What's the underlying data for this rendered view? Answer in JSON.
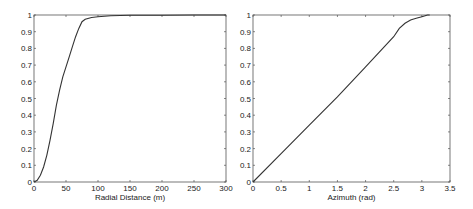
{
  "chart_data": [
    {
      "type": "line",
      "title": "",
      "xlabel": "Radial Distance (m)",
      "ylabel": "",
      "xlim": [
        0,
        300
      ],
      "ylim": [
        0,
        1
      ],
      "xticks": [
        0,
        50,
        100,
        150,
        200,
        250,
        300
      ],
      "yticks": [
        0,
        0.1,
        0.2,
        0.3,
        0.4,
        0.5,
        0.6,
        0.7,
        0.8,
        0.9,
        1
      ],
      "grid": false,
      "series": [
        {
          "name": "CDF",
          "x": [
            0,
            5,
            10,
            15,
            20,
            25,
            30,
            35,
            40,
            45,
            50,
            55,
            60,
            65,
            70,
            75,
            80,
            90,
            100,
            120,
            150,
            200,
            250,
            300
          ],
          "y": [
            0,
            0.01,
            0.04,
            0.09,
            0.16,
            0.25,
            0.35,
            0.46,
            0.55,
            0.63,
            0.69,
            0.75,
            0.81,
            0.87,
            0.92,
            0.96,
            0.975,
            0.985,
            0.99,
            0.995,
            0.998,
            0.999,
            1.0,
            1.0
          ]
        }
      ]
    },
    {
      "type": "line",
      "title": "",
      "xlabel": "Azimuth  (rad)",
      "ylabel": "",
      "xlim": [
        0,
        3.5
      ],
      "ylim": [
        0,
        1
      ],
      "xticks": [
        0,
        0.5,
        1,
        1.5,
        2,
        2.5,
        3,
        3.5
      ],
      "yticks": [
        0,
        0.1,
        0.2,
        0.3,
        0.4,
        0.5,
        0.6,
        0.7,
        0.8,
        0.9,
        1
      ],
      "grid": false,
      "series": [
        {
          "name": "CDF",
          "x": [
            0,
            0.5,
            1.0,
            1.5,
            2.0,
            2.5,
            2.6,
            2.7,
            2.8,
            2.9,
            3.0,
            3.1,
            3.14
          ],
          "y": [
            0,
            0.17,
            0.34,
            0.51,
            0.69,
            0.87,
            0.92,
            0.95,
            0.97,
            0.98,
            0.99,
            1.0,
            1.0
          ]
        }
      ]
    }
  ]
}
